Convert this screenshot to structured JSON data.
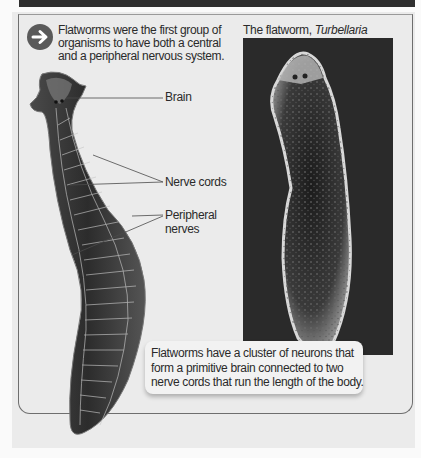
{
  "intro": {
    "icon": "arrow-right-circle-icon",
    "lines": [
      "Flatworms were the first group of",
      "organisms to have both a central",
      "and a peripheral nervous system."
    ]
  },
  "photo": {
    "caption_prefix": "The flatworm, ",
    "caption_species": "Turbellaria"
  },
  "diagram": {
    "labels": {
      "brain": "Brain",
      "nerve_cords": "Nerve cords",
      "peripheral_line1": "Peripheral",
      "peripheral_line2": "nerves"
    }
  },
  "callout": {
    "lines": [
      "Flatworms have a cluster of neurons that",
      "form a primitive brain connected to two",
      "nerve cords that run the length of the body."
    ]
  },
  "colors": {
    "top_bar": "#2e2e2e",
    "panel": "#ebebeb",
    "icon": "#5a5a5a",
    "photo_bg": "#2a2a2a"
  }
}
